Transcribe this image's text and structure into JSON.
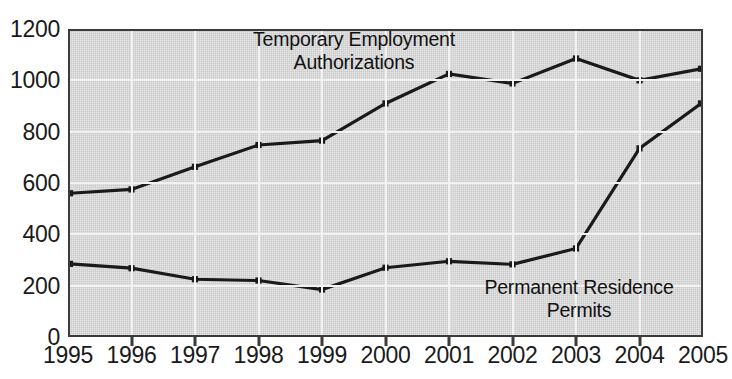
{
  "chart_data": {
    "type": "line",
    "title": "",
    "xlabel": "",
    "ylabel": "",
    "categories": [
      "1995",
      "1996",
      "1997",
      "1998",
      "1999",
      "2000",
      "2001",
      "2002",
      "2003",
      "2004",
      "2005"
    ],
    "ylim": [
      0,
      1200
    ],
    "yticks": [
      "0",
      "200",
      "400",
      "600",
      "800",
      "1000",
      "1200"
    ],
    "ytick_values": [
      0,
      200,
      400,
      600,
      800,
      1000,
      1200
    ],
    "grid": true,
    "legend_position": "inline-annotations",
    "series": [
      {
        "name": "Temporary Employment Authorizations",
        "values": [
          560,
          575,
          663,
          748,
          765,
          910,
          1025,
          988,
          1085,
          1000,
          1045
        ],
        "color": "#1a1a1a",
        "marker": "square"
      },
      {
        "name": "Permanent Residence Permits",
        "values": [
          285,
          268,
          225,
          220,
          185,
          270,
          295,
          283,
          345,
          735,
          910
        ],
        "color": "#1a1a1a",
        "marker": "square"
      }
    ],
    "annotations": [
      {
        "id": "upper",
        "line1": "Temporary Employment",
        "line2": "Authorizations"
      },
      {
        "id": "lower",
        "line1": "Permanent Residence",
        "line2": "Permits"
      }
    ],
    "colors": {
      "plot_background": "#c9c9c9",
      "gridline": "#f2f2f2",
      "axis": "#3b3b3b",
      "line": "#1a1a1a",
      "text": "#1a1a1a",
      "page_background": "#ffffff"
    }
  }
}
